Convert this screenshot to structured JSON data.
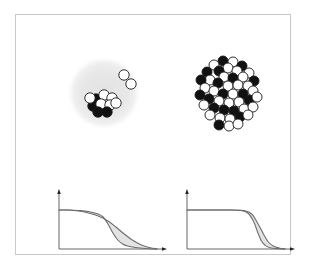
{
  "figure": {
    "border_color": "#c9c9c9",
    "background": "#ffffff"
  },
  "panels": [
    {
      "id": "nucleus-halo",
      "label": "Halo nucleus",
      "description": "Small compact core of nucleons surrounded by a large diffuse low-density halo, with two detached halo neutrons",
      "halo": {
        "visible": true,
        "color": "#e8e8e8",
        "edge_color": "#dcdcdc",
        "center_x": 50,
        "center_y": 50,
        "radius": 36
      },
      "core_nucleons": [
        {
          "x": 42,
          "y": 56,
          "fill": "#111111"
        },
        {
          "x": 50,
          "y": 52,
          "fill": "#ffffff"
        },
        {
          "x": 58,
          "y": 55,
          "fill": "#ffffff"
        },
        {
          "x": 39,
          "y": 63,
          "fill": "#111111"
        },
        {
          "x": 47,
          "y": 61,
          "fill": "#ffffff"
        },
        {
          "x": 56,
          "y": 62,
          "fill": "#ffffff"
        },
        {
          "x": 44,
          "y": 69,
          "fill": "#111111"
        },
        {
          "x": 53,
          "y": 69,
          "fill": "#111111"
        },
        {
          "x": 62,
          "y": 60,
          "fill": "#ffffff"
        },
        {
          "x": 36,
          "y": 55,
          "fill": "#ffffff"
        }
      ],
      "halo_nucleons": [
        {
          "x": 70,
          "y": 32,
          "fill": "#ffffff"
        },
        {
          "x": 77,
          "y": 41,
          "fill": "#ffffff"
        }
      ],
      "nucleon_radius": 5.2,
      "nucleon_stroke": "#1a1a1a"
    },
    {
      "id": "nucleus-dense",
      "label": "Ordinary nucleus",
      "description": "Large compact cluster of tightly packed alternating black and white nucleons with a sharp surface",
      "halo": {
        "visible": false
      },
      "nucleon_radius": 5.0,
      "nucleon_stroke": "#1a1a1a",
      "nucleons": [
        {
          "x": 37,
          "y": 10,
          "fill": "#111111"
        },
        {
          "x": 47,
          "y": 11,
          "fill": "#ffffff"
        },
        {
          "x": 28,
          "y": 14,
          "fill": "#ffffff"
        },
        {
          "x": 56,
          "y": 15,
          "fill": "#111111"
        },
        {
          "x": 42,
          "y": 17,
          "fill": "#ffffff"
        },
        {
          "x": 33,
          "y": 20,
          "fill": "#111111"
        },
        {
          "x": 51,
          "y": 20,
          "fill": "#ffffff"
        },
        {
          "x": 21,
          "y": 21,
          "fill": "#111111"
        },
        {
          "x": 63,
          "y": 22,
          "fill": "#ffffff"
        },
        {
          "x": 24,
          "y": 29,
          "fill": "#ffffff"
        },
        {
          "x": 38,
          "y": 26,
          "fill": "#ffffff"
        },
        {
          "x": 47,
          "y": 27,
          "fill": "#111111"
        },
        {
          "x": 57,
          "y": 26,
          "fill": "#ffffff"
        },
        {
          "x": 15,
          "y": 29,
          "fill": "#111111"
        },
        {
          "x": 68,
          "y": 30,
          "fill": "#111111"
        },
        {
          "x": 32,
          "y": 32,
          "fill": "#111111"
        },
        {
          "x": 42,
          "y": 35,
          "fill": "#ffffff"
        },
        {
          "x": 52,
          "y": 34,
          "fill": "#ffffff"
        },
        {
          "x": 62,
          "y": 35,
          "fill": "#ffffff"
        },
        {
          "x": 19,
          "y": 37,
          "fill": "#ffffff"
        },
        {
          "x": 28,
          "y": 40,
          "fill": "#ffffff"
        },
        {
          "x": 37,
          "y": 43,
          "fill": "#111111"
        },
        {
          "x": 47,
          "y": 43,
          "fill": "#ffffff"
        },
        {
          "x": 57,
          "y": 43,
          "fill": "#111111"
        },
        {
          "x": 67,
          "y": 40,
          "fill": "#ffffff"
        },
        {
          "x": 14,
          "y": 44,
          "fill": "#111111"
        },
        {
          "x": 23,
          "y": 48,
          "fill": "#111111"
        },
        {
          "x": 33,
          "y": 50,
          "fill": "#ffffff"
        },
        {
          "x": 43,
          "y": 52,
          "fill": "#ffffff"
        },
        {
          "x": 53,
          "y": 51,
          "fill": "#ffffff"
        },
        {
          "x": 63,
          "y": 49,
          "fill": "#111111"
        },
        {
          "x": 71,
          "y": 46,
          "fill": "#ffffff"
        },
        {
          "x": 18,
          "y": 54,
          "fill": "#ffffff"
        },
        {
          "x": 28,
          "y": 57,
          "fill": "#111111"
        },
        {
          "x": 38,
          "y": 59,
          "fill": "#111111"
        },
        {
          "x": 48,
          "y": 60,
          "fill": "#111111"
        },
        {
          "x": 58,
          "y": 58,
          "fill": "#ffffff"
        },
        {
          "x": 67,
          "y": 56,
          "fill": "#ffffff"
        },
        {
          "x": 24,
          "y": 64,
          "fill": "#ffffff"
        },
        {
          "x": 34,
          "y": 67,
          "fill": "#ffffff"
        },
        {
          "x": 44,
          "y": 68,
          "fill": "#ffffff"
        },
        {
          "x": 54,
          "y": 66,
          "fill": "#111111"
        },
        {
          "x": 62,
          "y": 64,
          "fill": "#ffffff"
        },
        {
          "x": 33,
          "y": 74,
          "fill": "#111111"
        },
        {
          "x": 43,
          "y": 75,
          "fill": "#ffffff"
        },
        {
          "x": 52,
          "y": 73,
          "fill": "#ffffff"
        }
      ]
    }
  ],
  "chart_data": [
    {
      "id": "profile-diffuse",
      "type": "area",
      "title": "",
      "xlabel": "",
      "ylabel": "",
      "description": "Matter density profile of a halo nucleus: a gradual, long-tailed surface fall-off; shaded band between a sharper inner curve and a diffuse outer curve",
      "axis": {
        "arrows": true,
        "color": "#555555",
        "x_range": [
          0,
          1
        ],
        "y_range": [
          0,
          1
        ]
      },
      "grid": false,
      "legend": "none",
      "series": [
        {
          "name": "core density (sharper fall-off)",
          "x": [
            0.0,
            0.1,
            0.2,
            0.3,
            0.4,
            0.45,
            0.5,
            0.55,
            0.6,
            0.65,
            0.7,
            0.78,
            0.88,
            1.0
          ],
          "values": [
            0.78,
            0.78,
            0.77,
            0.75,
            0.7,
            0.64,
            0.5,
            0.32,
            0.18,
            0.1,
            0.06,
            0.03,
            0.01,
            0.0
          ]
        },
        {
          "name": "halo density (diffuse tail)",
          "x": [
            0.0,
            0.1,
            0.2,
            0.3,
            0.4,
            0.5,
            0.58,
            0.66,
            0.74,
            0.82,
            0.9,
            1.0
          ],
          "values": [
            0.78,
            0.78,
            0.76,
            0.72,
            0.66,
            0.56,
            0.44,
            0.31,
            0.19,
            0.1,
            0.04,
            0.0
          ]
        }
      ],
      "shaded_between": true,
      "shade_color": "#e3e3e3"
    },
    {
      "id": "profile-sharp",
      "type": "area",
      "title": "",
      "xlabel": "",
      "ylabel": "",
      "description": "Matter density profile of an ordinary nucleus: flat plateau with an abrupt, sharp surface drop; narrow shaded band between two close curves",
      "axis": {
        "arrows": true,
        "color": "#555555",
        "x_range": [
          0,
          1
        ],
        "y_range": [
          0,
          1
        ]
      },
      "grid": false,
      "legend": "none",
      "series": [
        {
          "name": "inner density edge",
          "x": [
            0.0,
            0.2,
            0.4,
            0.55,
            0.62,
            0.68,
            0.72,
            0.76,
            0.8,
            0.86,
            1.0
          ],
          "values": [
            0.78,
            0.78,
            0.78,
            0.77,
            0.72,
            0.55,
            0.34,
            0.16,
            0.07,
            0.02,
            0.0
          ]
        },
        {
          "name": "outer density edge",
          "x": [
            0.0,
            0.2,
            0.4,
            0.58,
            0.66,
            0.72,
            0.78,
            0.83,
            0.88,
            0.94,
            1.0
          ],
          "values": [
            0.78,
            0.78,
            0.78,
            0.77,
            0.7,
            0.52,
            0.3,
            0.14,
            0.06,
            0.02,
            0.0
          ]
        }
      ],
      "shaded_between": true,
      "shade_color": "#e3e3e3"
    }
  ]
}
